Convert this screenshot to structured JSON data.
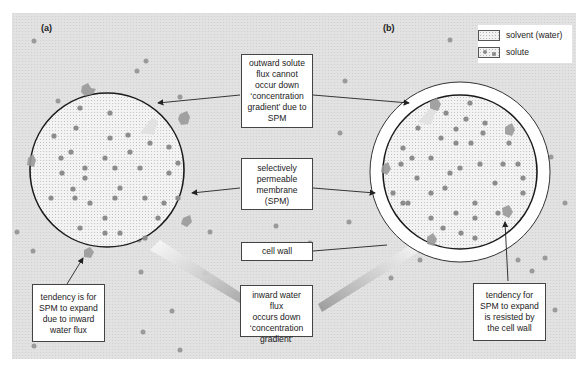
{
  "figure": {
    "panels": [
      {
        "id": "a",
        "label": "(a)"
      },
      {
        "id": "b",
        "label": "(b)"
      }
    ],
    "legend": {
      "items": [
        {
          "key": "solvent",
          "label": "solvent (water)"
        },
        {
          "key": "solute",
          "label": "solute"
        }
      ]
    },
    "callouts": {
      "outward_solute": [
        "outward solute",
        "flux cannot",
        "occur down",
        "‘concentration",
        "gradient’ due to",
        "SPM"
      ],
      "spm": [
        "selectively",
        "permeable",
        "membrane",
        "(SPM)"
      ],
      "cell_wall": [
        "cell wall"
      ],
      "inward_water": [
        "inward water flux",
        "occurs down",
        "‘concentration",
        "gradient’"
      ],
      "tendency_expand": [
        "tendency is for",
        "SPM to expand",
        "due to inward",
        "water flux"
      ],
      "tendency_resisted": [
        "tendency for",
        "SPM to expand",
        "is resisted by",
        "the cell wall"
      ]
    },
    "colors": {
      "background": "#e3e3e3",
      "cell_fill": "#f2f2f2",
      "solute_dot": "#8c8c8c",
      "membrane": "#1a1a1a",
      "cell_wall": "#ffffff",
      "flux_arrow": "#9a9a9a"
    }
  }
}
